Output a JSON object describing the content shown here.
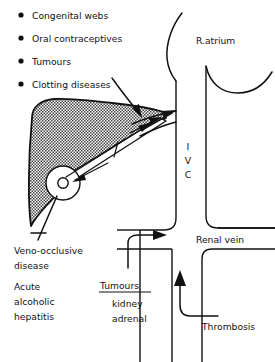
{
  "figure": {
    "background_color": "#ffffff",
    "ink_color": "#111111",
    "width": 275,
    "height": 362
  },
  "causes_list": {
    "bullet_glyph": "•",
    "items": [
      {
        "label": "Congenital webs"
      },
      {
        "label": "Oral contraceptives"
      },
      {
        "label": "Tumours"
      },
      {
        "label": "Clotting diseases"
      }
    ]
  },
  "anatomy_labels": {
    "right_atrium": "R.atrium",
    "ivc_letters": [
      "I",
      "V",
      "C"
    ],
    "renal_vein": "Renal vein",
    "thrombosis": "Thrombosis"
  },
  "liver_labels": {
    "veno_occlusive_line1": "Veno-occlusive",
    "veno_occlusive_line2": "disease",
    "acute_line1": "Acute",
    "acute_line2": "alcoholic",
    "acute_line3": "hepatitis"
  },
  "renal_tumour_block": {
    "heading": "Tumours",
    "items": [
      "kidney",
      "adrenal"
    ],
    "heading_underlined": true
  }
}
